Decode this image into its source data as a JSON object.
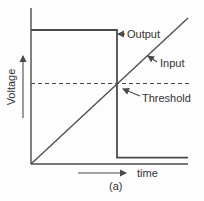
{
  "figure": {
    "caption": "(a)",
    "background": "#fdfdfd",
    "line_color": "#4b4b4b",
    "text_color": "#333333"
  },
  "chart_data": {
    "type": "line",
    "title": "",
    "xlabel": "time",
    "ylabel": "Voltage",
    "x_ticks": [],
    "y_ticks": [],
    "grid": false,
    "legend": "none-inline-annotations",
    "axis_arrows": true,
    "axis_range_note": "no numeric scale shown; coordinates normalized 0-1",
    "series": [
      {
        "name": "Output",
        "shape": "step",
        "dash": false,
        "width": 1.8,
        "points": [
          [
            0,
            0.937
          ],
          [
            0.548,
            0.937
          ],
          [
            0.548,
            0.045
          ],
          [
            1.0,
            0.045
          ]
        ]
      },
      {
        "name": "Input",
        "shape": "ramp",
        "dash": false,
        "width": 1.3,
        "points": [
          [
            0,
            0
          ],
          [
            1.0,
            1.02
          ]
        ]
      },
      {
        "name": "Threshold",
        "shape": "reference-line",
        "dash": true,
        "width": 1.2,
        "points": [
          [
            0,
            0.563
          ],
          [
            1.013,
            0.563
          ]
        ]
      }
    ],
    "annotations": [
      {
        "text": "Output",
        "tip": [
          118,
          34
        ],
        "tail": [
          125,
          34
        ]
      },
      {
        "text": "Input",
        "tip": [
          148,
          56
        ],
        "tail": [
          157,
          62
        ]
      },
      {
        "text": "Threshold",
        "tip": [
          123,
          89
        ],
        "tail": [
          140,
          96
        ]
      }
    ]
  }
}
